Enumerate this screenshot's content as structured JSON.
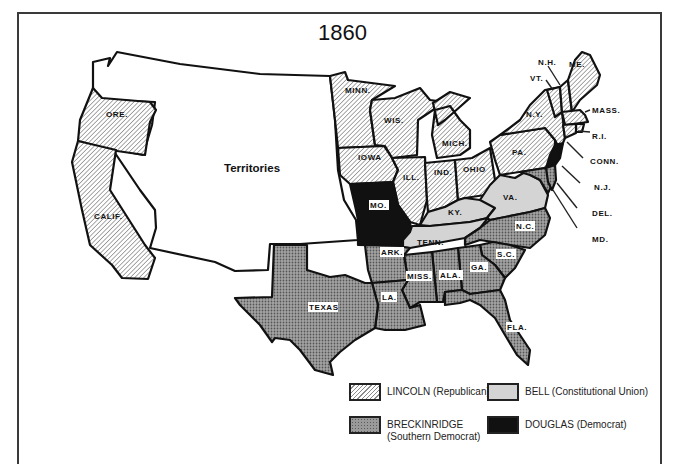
{
  "title": "1860",
  "colors": {
    "lincoln_hatch": "#8a8a8a",
    "bell": "#d4d4d4",
    "breckinridge": "#9a9a9a",
    "douglas": "#111111",
    "territories": "#ffffff",
    "border": "#111111"
  },
  "map": {
    "territories_label": "Territories",
    "states": {
      "ore": "ORE.",
      "calif": "CALIF.",
      "minn": "MINN.",
      "wis": "WIS.",
      "mich": "MICH.",
      "iowa": "IOWA",
      "ill": "ILL.",
      "ind": "IND.",
      "ohio": "OHIO",
      "pa": "PA.",
      "ny": "N.Y.",
      "vt": "VT.",
      "nh": "N.H.",
      "me": "ME.",
      "mass": "MASS.",
      "ri": "R.I.",
      "conn": "CONN.",
      "nj": "N.J.",
      "del": "DEL.",
      "md": "MD.",
      "mo": "MO.",
      "ky": "KY.",
      "va": "VA.",
      "tenn": "TENN.",
      "nc": "N.C.",
      "sc": "S.C.",
      "ga": "GA.",
      "ala": "ALA.",
      "miss": "MISS.",
      "ark": "ARK.",
      "la": "LA.",
      "texas": "TEXAS",
      "fla": "FLA."
    }
  },
  "legend": {
    "items": [
      {
        "key": "lincoln",
        "label": "LINCOLN  (Republican)"
      },
      {
        "key": "bell",
        "label": "BELL  (Constitutional Union)"
      },
      {
        "key": "breckinridge",
        "label_line1": "BRECKINRIDGE",
        "label_line2": "(Southern Democrat)"
      },
      {
        "key": "douglas",
        "label": "DOUGLAS  (Democrat)"
      }
    ]
  },
  "results": {
    "lincoln": [
      "ORE.",
      "CALIF.",
      "MINN.",
      "WIS.",
      "MICH.",
      "IOWA",
      "ILL.",
      "IND.",
      "OHIO",
      "PA.",
      "N.Y.",
      "VT.",
      "N.H.",
      "ME.",
      "MASS.",
      "R.I.",
      "CONN.",
      "N.J."
    ],
    "bell": [
      "VA.",
      "KY.",
      "TENN."
    ],
    "breckinridge": [
      "TEXAS",
      "ARK.",
      "LA.",
      "MISS.",
      "ALA.",
      "GA.",
      "FLA.",
      "S.C.",
      "N.C.",
      "MD.",
      "DEL."
    ],
    "douglas": [
      "MO.",
      "N.J."
    ]
  }
}
